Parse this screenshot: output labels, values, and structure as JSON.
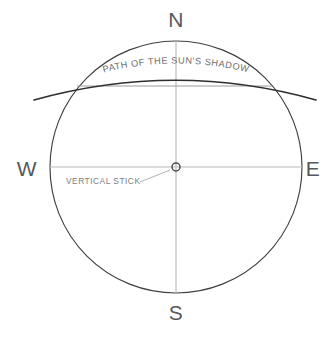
{
  "diagram": {
    "compass": {
      "north": "N",
      "south": "S",
      "west": "W",
      "east": "E"
    },
    "labels": {
      "shadow_path": "PATH OF THE SUN'S SHADOW",
      "vertical_stick": "VERTICAL STICK"
    },
    "colors": {
      "background": "#ffffff",
      "circle_stroke": "#3f3f41",
      "arc_stroke": "#2e2e30",
      "axis_stroke": "#b9babc",
      "chord_stroke": "#9b9c9e",
      "compass_text": "#58585a",
      "curved_text": "#6d6e70",
      "stick_text": "#7d7e80"
    },
    "geometry": {
      "center_x": 176,
      "center_y": 167,
      "radius": 126,
      "chord_y": 86,
      "chord_left_x": 77,
      "chord_right_x": 272
    }
  }
}
